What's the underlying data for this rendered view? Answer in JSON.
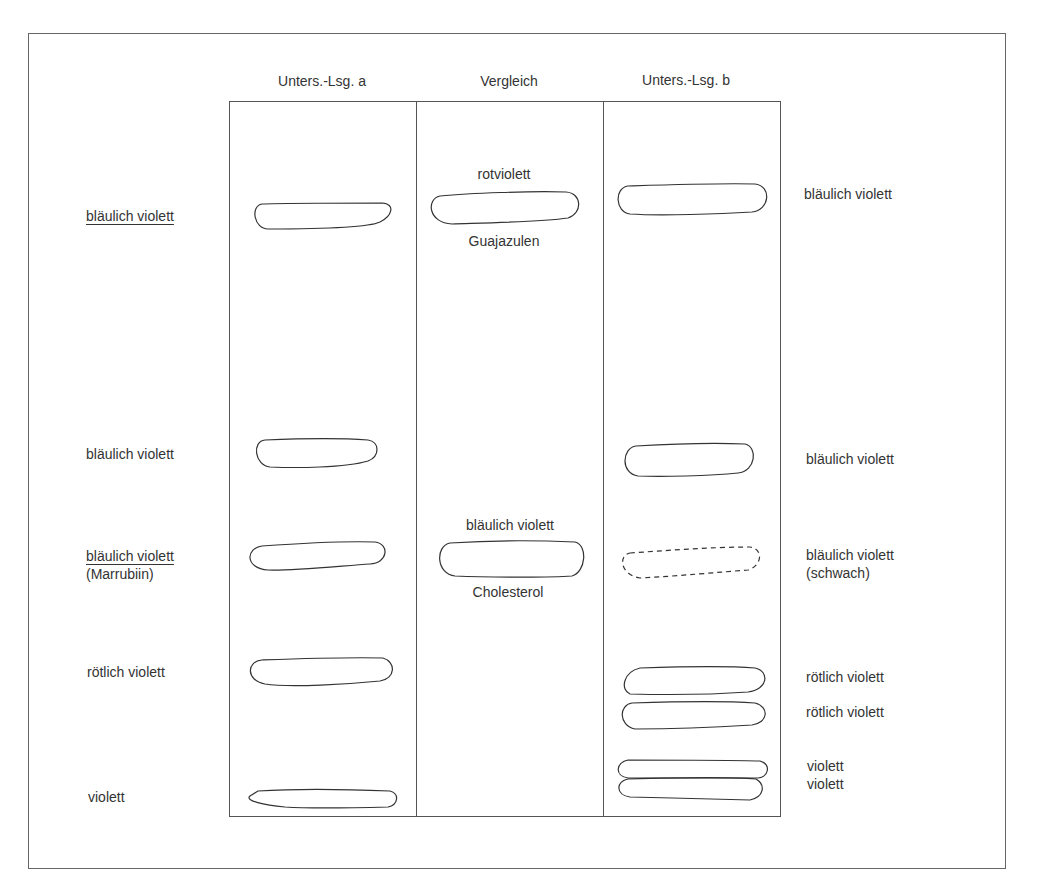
{
  "diagram": {
    "type": "thin-layer chromatogram (schematic)",
    "lanes": [
      {
        "id": "a",
        "header": "Unters.-Lsg. a"
      },
      {
        "id": "ref",
        "header": "Vergleich"
      },
      {
        "id": "b",
        "header": "Unters.-Lsg. b"
      }
    ],
    "left_labels": [
      {
        "text": "bläulich violett",
        "underlined": true
      },
      {
        "text": "bläulich violett",
        "underlined": false
      },
      {
        "text": "bläulich violett",
        "underlined": true,
        "sub": "(Marrubiin)"
      },
      {
        "text": "rötlich violett",
        "underlined": false
      },
      {
        "text": "violett",
        "underlined": false
      }
    ],
    "reference": [
      {
        "above": "rotviolett",
        "below": "Guajazulen"
      },
      {
        "above": "bläulich violett",
        "below": "Cholesterol"
      }
    ],
    "right_labels": [
      {
        "text": "bläulich violett"
      },
      {
        "text": "bläulich violett"
      },
      {
        "text": "bläulich violett",
        "sub": "(schwach)"
      },
      {
        "text": "rötlich violett"
      },
      {
        "text": "rötlich violett"
      },
      {
        "text": "violett"
      },
      {
        "text": "violett"
      }
    ]
  }
}
